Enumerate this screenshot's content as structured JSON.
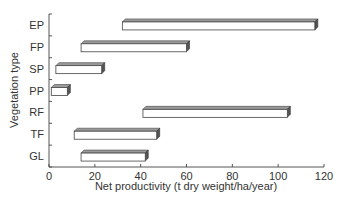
{
  "chart_data": {
    "type": "bar",
    "orientation": "horizontal",
    "style": "floating range bars (3D box)",
    "title": "",
    "xlabel": "Net productivity (t dry weight/ha/year)",
    "ylabel": "Vegetation type",
    "xlim": [
      0,
      120
    ],
    "xticks": [
      0,
      20,
      40,
      60,
      80,
      100,
      120
    ],
    "grid": false,
    "legend": null,
    "categories": [
      "EP",
      "FP",
      "SP",
      "PP",
      "RF",
      "TF",
      "GL"
    ],
    "series": [
      {
        "name": "Net productivity range",
        "ranges": [
          {
            "category": "EP",
            "min": 32,
            "max": 116
          },
          {
            "category": "FP",
            "min": 14,
            "max": 60
          },
          {
            "category": "SP",
            "min": 3,
            "max": 23
          },
          {
            "category": "PP",
            "min": 1,
            "max": 8
          },
          {
            "category": "RF",
            "min": 41,
            "max": 104
          },
          {
            "category": "TF",
            "min": 11,
            "max": 47
          },
          {
            "category": "GL",
            "min": 14,
            "max": 42
          }
        ]
      }
    ]
  },
  "colors": {
    "bar_face": "#ffffff",
    "bar_top": "#9a9a9a",
    "bar_side": "#555555",
    "axis": "#555555",
    "text": "#333333"
  }
}
